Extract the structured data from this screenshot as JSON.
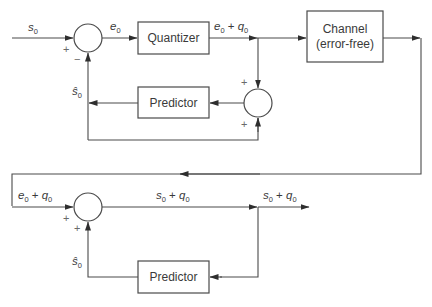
{
  "encoder": {
    "input_label": "s",
    "input_sub": "0",
    "error_label": "e",
    "error_sub": "0",
    "quantizer_label": "Quantizer",
    "quantized_label_a": "e",
    "quantized_label_a_sub": "0",
    "quantized_label_plus": " + ",
    "quantized_label_b": "q",
    "quantized_label_b_sub": "0",
    "channel_label_line1": "Channel",
    "channel_label_line2": "(error-free)",
    "predictor_label": "Predictor",
    "prediction_label": "ŝ",
    "prediction_sub": "0",
    "sum1_signs": [
      "+",
      "−"
    ],
    "sum2_signs": [
      "+",
      "+"
    ]
  },
  "decoder": {
    "input_label_a": "e",
    "input_label_a_sub": "0",
    "input_label_plus": " + ",
    "input_label_b": "q",
    "input_label_b_sub": "0",
    "mid_label_a": "s",
    "mid_label_a_sub": "0",
    "mid_label_plus": " + ",
    "mid_label_b": "q",
    "mid_label_b_sub": "0",
    "output_label_a": "s",
    "output_label_a_sub": "0",
    "output_label_plus": " + ",
    "output_label_b": "q",
    "output_label_b_sub": "0",
    "predictor_label": "Predictor",
    "prediction_label": "ŝ",
    "prediction_sub": "0",
    "sum_signs": [
      "+",
      "+"
    ]
  },
  "colors": {
    "line": "#4a4a4a",
    "text": "#3a3a3a",
    "background": "#ffffff"
  }
}
